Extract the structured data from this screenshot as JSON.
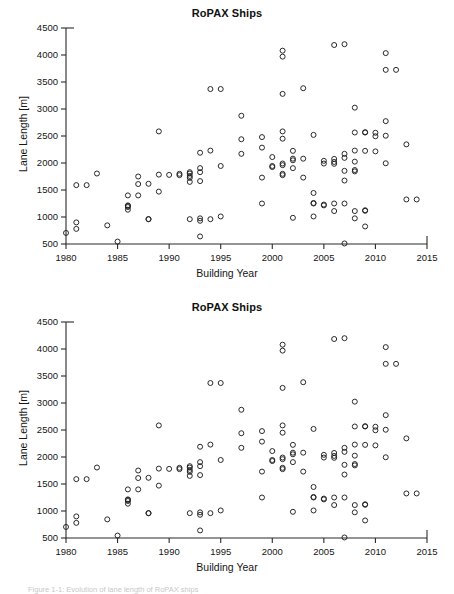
{
  "figure": {
    "caption": "Figure 1-1: Evolution of lane length of RoPAX ships"
  },
  "panels": [
    {
      "id": "top",
      "title": "RoPAX Ships"
    },
    {
      "id": "bottom",
      "title": "RoPAX Ships"
    }
  ],
  "chart_data": {
    "type": "scatter",
    "title": "RoPAX Ships",
    "xlabel": "Building Year",
    "ylabel": "Lane Length [m]",
    "xlim": [
      1980,
      2015
    ],
    "ylim": [
      500,
      4500
    ],
    "xticks": [
      1980,
      1985,
      1990,
      1995,
      2000,
      2005,
      2010,
      2015
    ],
    "yticks": [
      500,
      1000,
      1500,
      2000,
      2500,
      3000,
      3500,
      4000,
      4500
    ],
    "grid": false,
    "legend": "none",
    "marker": "open-circle",
    "marker_color": "#1f1f1f",
    "series": [
      {
        "name": "RoPAX ships",
        "points": [
          [
            1980,
            705
          ],
          [
            1981,
            1590
          ],
          [
            1981,
            900
          ],
          [
            1981,
            780
          ],
          [
            1982,
            1590
          ],
          [
            1983,
            1805
          ],
          [
            1984,
            845
          ],
          [
            1985,
            545
          ],
          [
            1986,
            1185
          ],
          [
            1986,
            1135
          ],
          [
            1986,
            1400
          ],
          [
            1986,
            1215
          ],
          [
            1986,
            1205
          ],
          [
            1987,
            1750
          ],
          [
            1987,
            1610
          ],
          [
            1987,
            1400
          ],
          [
            1988,
            1615
          ],
          [
            1988,
            960
          ],
          [
            1988,
            960
          ],
          [
            1989,
            2585
          ],
          [
            1989,
            1785
          ],
          [
            1989,
            1470
          ],
          [
            1990,
            1780
          ],
          [
            1991,
            1800
          ],
          [
            1991,
            1775
          ],
          [
            1992,
            1830
          ],
          [
            1992,
            1805
          ],
          [
            1992,
            1760
          ],
          [
            1992,
            1725
          ],
          [
            1992,
            1650
          ],
          [
            1992,
            960
          ],
          [
            1993,
            2190
          ],
          [
            1993,
            1905
          ],
          [
            1993,
            1830
          ],
          [
            1993,
            1665
          ],
          [
            1993,
            975
          ],
          [
            1993,
            930
          ],
          [
            1993,
            640
          ],
          [
            1994,
            3370
          ],
          [
            1994,
            2230
          ],
          [
            1994,
            960
          ],
          [
            1995,
            3370
          ],
          [
            1995,
            1945
          ],
          [
            1995,
            1010
          ],
          [
            1997,
            2875
          ],
          [
            1997,
            2440
          ],
          [
            1997,
            2170
          ],
          [
            1999,
            2480
          ],
          [
            1999,
            2285
          ],
          [
            1999,
            1730
          ],
          [
            1999,
            1250
          ],
          [
            2000,
            2110
          ],
          [
            2000,
            1945
          ],
          [
            2000,
            1925
          ],
          [
            2001,
            4080
          ],
          [
            2001,
            3970
          ],
          [
            2001,
            3280
          ],
          [
            2001,
            2585
          ],
          [
            2001,
            2450
          ],
          [
            2001,
            1990
          ],
          [
            2001,
            1960
          ],
          [
            2001,
            1800
          ],
          [
            2001,
            1775
          ],
          [
            2002,
            2225
          ],
          [
            2002,
            2080
          ],
          [
            2002,
            2050
          ],
          [
            2002,
            1905
          ],
          [
            2002,
            985
          ],
          [
            2003,
            3385
          ],
          [
            2003,
            2080
          ],
          [
            2003,
            1730
          ],
          [
            2004,
            2520
          ],
          [
            2004,
            1445
          ],
          [
            2004,
            1260
          ],
          [
            2004,
            1250
          ],
          [
            2004,
            1010
          ],
          [
            2005,
            2040
          ],
          [
            2005,
            1990
          ],
          [
            2005,
            1230
          ],
          [
            2005,
            1215
          ],
          [
            2006,
            4185
          ],
          [
            2006,
            2075
          ],
          [
            2006,
            2020
          ],
          [
            2006,
            1985
          ],
          [
            2006,
            1250
          ],
          [
            2006,
            1110
          ],
          [
            2007,
            4200
          ],
          [
            2007,
            2170
          ],
          [
            2007,
            2095
          ],
          [
            2007,
            1855
          ],
          [
            2007,
            1675
          ],
          [
            2007,
            1250
          ],
          [
            2007,
            510
          ],
          [
            2008,
            3025
          ],
          [
            2008,
            2565
          ],
          [
            2008,
            2230
          ],
          [
            2008,
            2025
          ],
          [
            2008,
            1870
          ],
          [
            2008,
            1845
          ],
          [
            2008,
            1110
          ],
          [
            2008,
            975
          ],
          [
            2009,
            2570
          ],
          [
            2009,
            2565
          ],
          [
            2009,
            2225
          ],
          [
            2009,
            1125
          ],
          [
            2009,
            1115
          ],
          [
            2009,
            825
          ],
          [
            2010,
            2560
          ],
          [
            2010,
            2495
          ],
          [
            2010,
            2215
          ],
          [
            2011,
            4035
          ],
          [
            2011,
            3725
          ],
          [
            2011,
            2775
          ],
          [
            2011,
            2505
          ],
          [
            2011,
            1995
          ],
          [
            2012,
            3725
          ],
          [
            2013,
            2345
          ],
          [
            2013,
            1325
          ],
          [
            2014,
            1325
          ]
        ]
      }
    ]
  }
}
